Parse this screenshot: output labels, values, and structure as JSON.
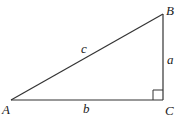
{
  "diagram": {
    "vertices": {
      "A": {
        "label": "A",
        "x": 11,
        "y": 100
      },
      "B": {
        "label": "B",
        "x": 163,
        "y": 14
      },
      "C": {
        "label": "C",
        "x": 163,
        "y": 100
      }
    },
    "sides": {
      "a": {
        "label": "a",
        "from": "B",
        "to": "C"
      },
      "b": {
        "label": "b",
        "from": "A",
        "to": "C"
      },
      "c": {
        "label": "c",
        "from": "A",
        "to": "B"
      }
    },
    "right_angle_at": "C",
    "colors": {
      "stroke": "#333333",
      "text": "#222222",
      "background": "#ffffff"
    }
  }
}
